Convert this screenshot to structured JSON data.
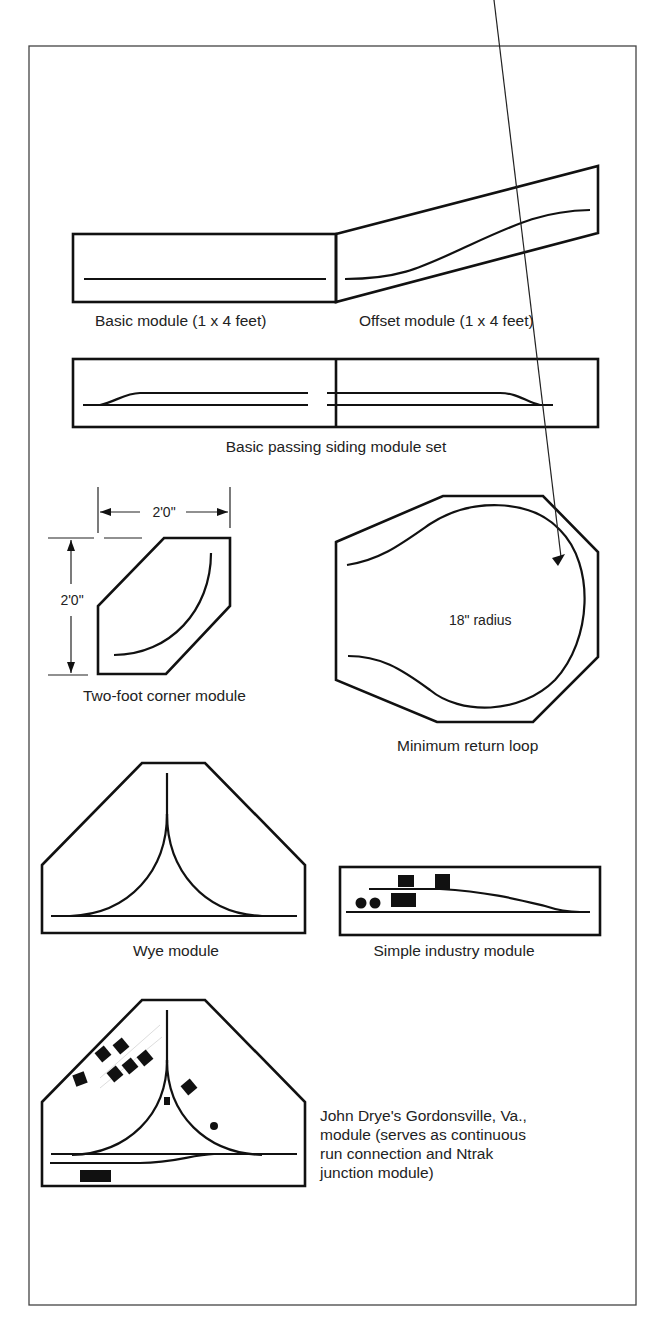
{
  "figure": {
    "modules": [
      {
        "id": "basic",
        "caption": "Basic module (1 x 4 feet)"
      },
      {
        "id": "offset",
        "caption": "Offset module (1 x 4 feet)"
      },
      {
        "id": "passing-siding",
        "caption": "Basic passing siding module set"
      },
      {
        "id": "corner",
        "caption": "Two-foot corner module",
        "width_label": "2'0\"",
        "height_label": "2'0\""
      },
      {
        "id": "return-loop",
        "caption": "Minimum return loop",
        "radius_label": "18\" radius"
      },
      {
        "id": "wye",
        "caption": "Wye module"
      },
      {
        "id": "industry",
        "caption": "Simple industry module"
      },
      {
        "id": "gordonsville",
        "caption_lines": [
          "John Drye's Gordonsville, Va.,",
          "module (serves as continuous",
          "run connection and Ntrak",
          "junction module)"
        ]
      }
    ]
  }
}
